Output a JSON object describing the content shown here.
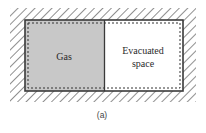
{
  "diagram": {
    "left_chamber": {
      "label": "Gas",
      "fill": "#c8c8c8"
    },
    "right_chamber": {
      "label_line1": "Evacuated",
      "label_line2": "space",
      "fill": "#ffffff"
    },
    "caption": "(a)",
    "colors": {
      "wall": "#3a3a3a",
      "hatch": "#333333",
      "dashed_boundary": "#333333"
    }
  }
}
